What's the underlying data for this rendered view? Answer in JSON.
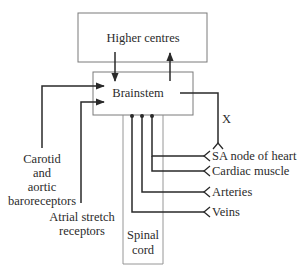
{
  "diagram": {
    "boxes": {
      "higher_centres": "Higher centres",
      "brainstem": "Brainstem",
      "spinal_cord_line1": "Spinal",
      "spinal_cord_line2": "cord"
    },
    "afferents": {
      "carotid_line1": "Carotid",
      "carotid_line2": "and",
      "carotid_line3": "aortic",
      "carotid_line4": "baroreceptors",
      "atrial_line1": "Atrial stretch",
      "atrial_line2": "receptors"
    },
    "efferents": {
      "sa_node": "SA node of heart",
      "cardiac_muscle": "Cardiac muscle",
      "arteries": "Arteries",
      "veins": "Veins"
    },
    "pathway_marker": "X",
    "colors": {
      "line": "#2a2a2a",
      "box": "#7a7a7a",
      "text": "#2b2b2b"
    }
  }
}
